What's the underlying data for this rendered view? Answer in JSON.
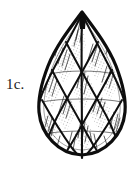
{
  "page": {
    "width": 138,
    "height": 173,
    "background_color": "#ffffff",
    "ink_color": "#111111"
  },
  "figure": {
    "label": "1c.",
    "caption_position": "left-of-figure",
    "style": "black-and-white scanned line engraving"
  },
  "illustration": {
    "outline_name": "gem-outline",
    "apex": {
      "x": 82,
      "y": 11
    },
    "base": {
      "x": 82,
      "y": 156
    },
    "left_extreme": {
      "x": 39,
      "y": 112
    },
    "right_extreme": {
      "x": 126,
      "y": 110
    },
    "stroke_width_outline": 3.2,
    "stroke_width_facet": 2.0,
    "stroke_width_hatch": 0.7,
    "apex_cap": {
      "name": "apex-dark-wedge",
      "x": 79,
      "y": 17,
      "width": 7,
      "height": 11
    },
    "lattice": {
      "type": "diamond-crosshatch",
      "columns": 4,
      "rows": 6,
      "center_axis": true
    }
  }
}
